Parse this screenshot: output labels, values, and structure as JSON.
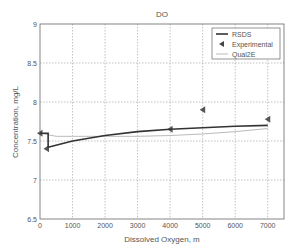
{
  "chart_data": {
    "type": "line",
    "title": "DO",
    "xlabel": "Dissolved Oxygen, m",
    "ylabel": "Concentration, mg/L",
    "xlim": [
      0,
      7500
    ],
    "ylim": [
      6.5,
      9
    ],
    "xticks": [
      0,
      1000,
      2000,
      3000,
      4000,
      5000,
      6000,
      7000
    ],
    "yticks": [
      6.5,
      7,
      7.5,
      8,
      8.5,
      9
    ],
    "grid": true,
    "legend_position": "upper right",
    "series": [
      {
        "name": "RSDS",
        "style": "line",
        "color": "#333333",
        "width": 1.6,
        "x": [
          0,
          250,
          250,
          1000,
          2000,
          3000,
          4000,
          5000,
          6000,
          7000
        ],
        "y": [
          7.6,
          7.6,
          7.42,
          7.5,
          7.57,
          7.62,
          7.65,
          7.67,
          7.69,
          7.7
        ]
      },
      {
        "name": "Experimental",
        "style": "marker",
        "marker": "triangle-left",
        "color": "#555555",
        "x": [
          0,
          200,
          4000,
          5000,
          7000
        ],
        "y": [
          7.6,
          7.4,
          7.65,
          7.9,
          7.78
        ]
      },
      {
        "name": "Qual2E",
        "style": "line",
        "color": "#bbbbbb",
        "width": 1,
        "x": [
          0,
          500,
          1000,
          2000,
          3000,
          4000,
          5000,
          6000,
          7000
        ],
        "y": [
          7.6,
          7.56,
          7.56,
          7.56,
          7.56,
          7.57,
          7.59,
          7.62,
          7.66
        ]
      }
    ]
  }
}
